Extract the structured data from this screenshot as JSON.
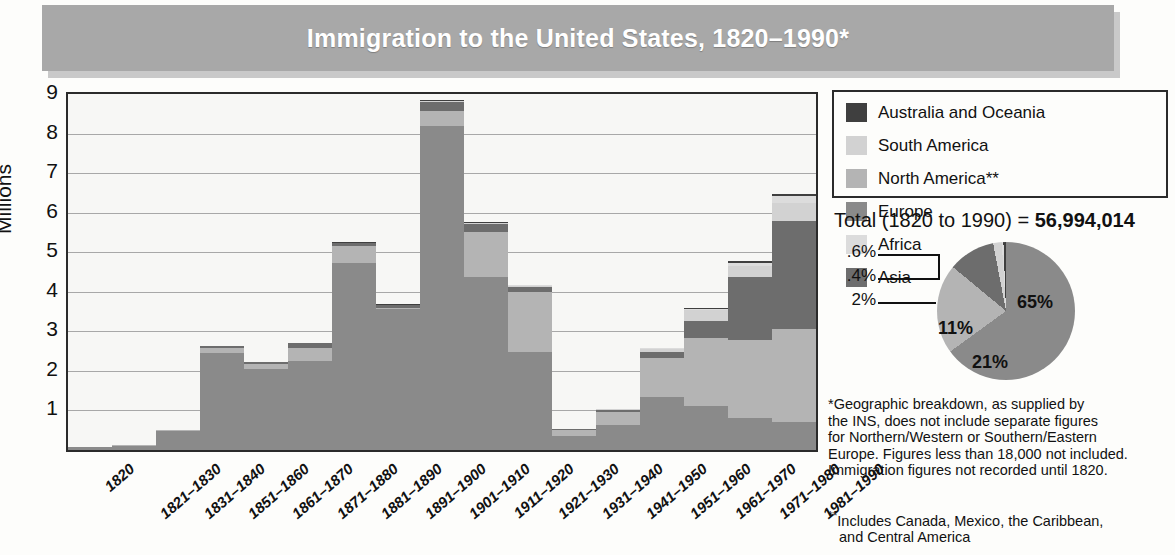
{
  "title": "Immigration to the United States, 1820–1990*",
  "axis": {
    "y_title": "Millions",
    "y_ticks": [
      "9",
      "8",
      "7",
      "6",
      "5",
      "4",
      "3",
      "2",
      "1"
    ]
  },
  "legend": {
    "left_column": [
      {
        "label": "Australia and Oceania",
        "color": "#3f3f3f"
      },
      {
        "label": "South America",
        "color": "#d2d2d2"
      },
      {
        "label": "North America**",
        "color": "#b4b4b4"
      }
    ],
    "right_column": [
      {
        "label": "Europe",
        "color": "#8a8a8a"
      },
      {
        "label": "Africa",
        "color": "#dcdcdc"
      },
      {
        "label": "Asia",
        "color": "#6d6d6d"
      }
    ]
  },
  "total": {
    "prefix": "Total (1820 to 1990) = ",
    "value": "56,994,014"
  },
  "footnotes": {
    "one_marker": "*",
    "one": "Geographic breakdown, as supplied by the INS, does not include separate figures for Northern/Western or Southern/Eastern Europe. Figures less than 18,000 not included. Immigration figures not recorded until 1820.",
    "one_lines": [
      "*Geographic breakdown, as supplied by",
      "the INS, does not include separate figures",
      "for Northern/Western or Southern/Eastern",
      "Europe. Figures less than 18,000 not included.",
      "Immigration figures not recorded until 1820."
    ],
    "two_marker": "**",
    "two_lines": [
      "Includes Canada, Mexico, the Caribbean,",
      "and Central America"
    ]
  },
  "chart_data": {
    "type": "bar",
    "title": "Immigration to the United States, 1820–1990*",
    "xlabel": "",
    "ylabel": "Millions",
    "ylim": [
      0,
      9
    ],
    "grid": true,
    "stacked": true,
    "legend_position": "top-right",
    "categories": [
      "1820",
      "1821–1830",
      "1831–1840",
      "1851–1860",
      "1861–1870",
      "1871–1880",
      "1881–1890",
      "1891–1900",
      "1901–1910",
      "1911–1920",
      "1921–1930",
      "1931–1940",
      "1941–1950",
      "1951–1960",
      "1961–1970",
      "1971–1980",
      "1981–1990"
    ],
    "series": [
      {
        "name": "Europe",
        "color": "#8a8a8a",
        "values": [
          0.07,
          0.1,
          0.48,
          2.45,
          2.05,
          2.25,
          4.74,
          3.56,
          8.2,
          4.38,
          2.48,
          0.35,
          0.62,
          1.33,
          1.12,
          0.8,
          0.7
        ]
      },
      {
        "name": "North America**",
        "color": "#b4b4b4",
        "values": [
          0.01,
          0.02,
          0.02,
          0.13,
          0.12,
          0.33,
          0.43,
          0.04,
          0.36,
          1.14,
          1.52,
          0.16,
          0.35,
          1.0,
          1.72,
          1.98,
          2.35
        ]
      },
      {
        "name": "Asia",
        "color": "#6d6d6d",
        "values": [
          0.0,
          0.0,
          0.0,
          0.04,
          0.06,
          0.12,
          0.07,
          0.07,
          0.25,
          0.19,
          0.11,
          0.02,
          0.04,
          0.15,
          0.43,
          1.59,
          2.74
        ]
      },
      {
        "name": "South America",
        "color": "#d2d2d2",
        "values": [
          0.0,
          0.0,
          0.0,
          0.0,
          0.0,
          0.0,
          0.0,
          0.0,
          0.02,
          0.04,
          0.04,
          0.01,
          0.02,
          0.08,
          0.26,
          0.29,
          0.46
        ]
      },
      {
        "name": "Africa",
        "color": "#dcdcdc",
        "values": [
          0.0,
          0.0,
          0.0,
          0.0,
          0.0,
          0.0,
          0.0,
          0.0,
          0.0,
          0.0,
          0.01,
          0.0,
          0.01,
          0.01,
          0.03,
          0.08,
          0.18
        ]
      },
      {
        "name": "Australia and Oceania",
        "color": "#3f3f3f",
        "values": [
          0.0,
          0.0,
          0.0,
          0.0,
          0.0,
          0.01,
          0.01,
          0.01,
          0.01,
          0.01,
          0.01,
          0.0,
          0.01,
          0.01,
          0.03,
          0.04,
          0.04
        ]
      }
    ],
    "totals": [
      0.08,
      0.13,
      0.6,
      2.62,
      2.15,
      2.88,
      5.35,
      3.69,
      8.8,
      5.74,
      4.11,
      0.53,
      0.86,
      2.51,
      3.21,
      4.49,
      5.84
    ],
    "pie": {
      "type": "pie",
      "title": "Total (1820 to 1990) = 56,994,014",
      "total": 56994014,
      "slices": [
        {
          "label": "65%",
          "value": 65,
          "name": "Europe",
          "color": "#8a8a8a"
        },
        {
          "label": "21%",
          "value": 21,
          "name": "North America**",
          "color": "#b4b4b4"
        },
        {
          "label": "11%",
          "value": 11,
          "name": "Asia",
          "color": "#6d6d6d"
        },
        {
          "label": "2%",
          "value": 2,
          "name": "South America",
          "color": "#d2d2d2"
        },
        {
          "label": ".4%",
          "value": 0.4,
          "name": "Africa",
          "color": "#dcdcdc"
        },
        {
          "label": ".6%",
          "value": 0.6,
          "name": "Australia and Oceania",
          "color": "#3f3f3f"
        }
      ]
    }
  }
}
